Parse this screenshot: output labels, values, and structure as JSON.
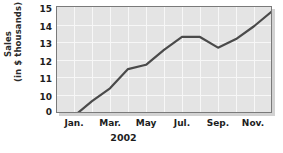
{
  "chart_data": {
    "type": "line",
    "title": "",
    "subtitle": "",
    "xlabel": "2002",
    "ylabel": "Sales\n(in $ thousands)",
    "ylabel_lines": [
      "Sales",
      "(in $ thousands)"
    ],
    "categories": [
      "Jan.",
      "Feb.",
      "Mar.",
      "Apr.",
      "May",
      "Jun.",
      "Jul.",
      "Aug.",
      "Sep.",
      "Oct.",
      "Nov.",
      "Dec."
    ],
    "x_tick_labels": [
      "Jan.",
      "Mar.",
      "May",
      "Jul.",
      "Sep.",
      "Nov."
    ],
    "x_tick_indices": [
      0,
      2,
      4,
      6,
      8,
      10
    ],
    "values": [
      9.9,
      10.6,
      11.2,
      12.1,
      12.3,
      13.0,
      13.6,
      13.6,
      13.1,
      13.5,
      14.1,
      14.8
    ],
    "y_tick_labels": [
      "15",
      "14",
      "13",
      "12",
      "11",
      "10",
      "0"
    ],
    "y_tick_values": [
      15,
      14,
      13,
      12,
      11,
      10,
      0
    ],
    "ylim": [
      10,
      15
    ],
    "axis_break": true,
    "axis_break_note": "y-axis broken between 0 and 10",
    "grid": true,
    "grid_color": "#f7f7f7",
    "legend": "none",
    "series": [
      {
        "name": "Sales",
        "color": "#4a4a4a",
        "values": [
          9.9,
          10.6,
          11.2,
          12.1,
          12.3,
          13.0,
          13.6,
          13.6,
          13.1,
          13.5,
          14.1,
          14.8
        ]
      }
    ],
    "plot_background": "#e4e4e4",
    "line_color": "#4a4a4a"
  },
  "axes": {
    "y_title_line1": "Sales",
    "y_title_line2": "(in $ thousands)",
    "x_title": "2002"
  },
  "y_ticks": [
    {
      "label": "15",
      "top": 6
    },
    {
      "label": "14",
      "top": 23.6
    },
    {
      "label": "13",
      "top": 41.2
    },
    {
      "label": "12",
      "top": 58.8
    },
    {
      "label": "11",
      "top": 76.4
    },
    {
      "label": "10",
      "top": 94
    },
    {
      "label": "0",
      "top": 113
    }
  ],
  "x_ticks": [
    {
      "label": "Jan.",
      "left": 74
    },
    {
      "label": "Mar.",
      "left": 110
    },
    {
      "label": "May",
      "left": 146
    },
    {
      "label": "Jul.",
      "left": 182
    },
    {
      "label": "Sep.",
      "left": 218
    },
    {
      "label": "Nov.",
      "left": 253
    }
  ]
}
